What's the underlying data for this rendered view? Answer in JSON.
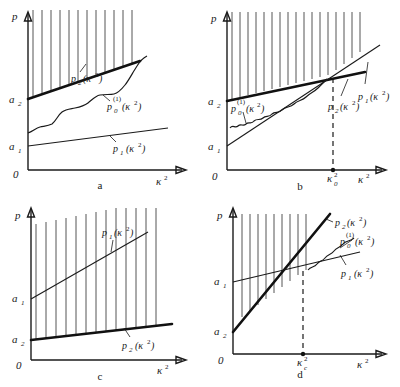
{
  "figure": {
    "title": "",
    "panel_count": 4,
    "axis": {
      "y_label": "p",
      "x_label": "κ²",
      "origin_label": "0"
    }
  },
  "panels": [
    {
      "letter": "a",
      "y_ticks": [
        {
          "base": "a",
          "sub": "2",
          "value_note": "upper intercept of p2"
        },
        {
          "base": "a",
          "sub": "1",
          "value_note": "lower intercept of p1"
        }
      ],
      "x_ticks": [],
      "curves": [
        {
          "name": "p2",
          "label_base": "p",
          "label_sub": "2",
          "label_arg": "(κ²)",
          "label_sup": "",
          "style": "thick-straight",
          "note": "upper bounding line, hatched above"
        },
        {
          "name": "p0_1",
          "label_base": "p",
          "label_sub": "0",
          "label_arg": "(κ²)",
          "label_sup": "(1)",
          "style": "wiggly",
          "note": "staircase-like oscillating curve between p1 and p2"
        },
        {
          "name": "p1",
          "label_base": "p",
          "label_sub": "1",
          "label_arg": "(κ²)",
          "label_sup": "",
          "style": "thin-straight",
          "note": "lowest line, shallow slope"
        }
      ],
      "hatching": {
        "region": "above p2 line",
        "direction": "vertical"
      }
    },
    {
      "letter": "b",
      "y_ticks": [
        {
          "base": "a",
          "sub": "2",
          "value_note": "intercept of p2"
        },
        {
          "base": "a",
          "sub": "1",
          "value_note": "intercept of p1, below a2"
        }
      ],
      "x_ticks": [
        {
          "base": "κ",
          "sub": "0",
          "sup": "2",
          "value_note": "crossing point of p1 and p2"
        }
      ],
      "curves": [
        {
          "name": "p2",
          "label_base": "p",
          "label_sub": "2",
          "label_arg": "(κ²)",
          "label_sup": "",
          "style": "thick-straight",
          "note": "shallow line from a2"
        },
        {
          "name": "p1",
          "label_base": "p",
          "label_sub": "1",
          "label_arg": "(κ²)",
          "label_sup": "",
          "style": "thin-straight",
          "note": "steeper line from a1, crosses p2 at kappa0^2"
        },
        {
          "name": "p0_1",
          "label_base": "p",
          "label_sub": "0",
          "label_arg": "(κ²)",
          "label_sup": "(1)",
          "style": "wiggly",
          "note": "oscillating curve near a2 rising to the crossing"
        }
      ],
      "hatching": {
        "region": "above min(p1,p2) envelope",
        "direction": "vertical"
      },
      "dashed_guide": {
        "from": "crossing point",
        "to": "x-axis at kappa0^2"
      }
    },
    {
      "letter": "c",
      "y_ticks": [
        {
          "base": "a",
          "sub": "1",
          "value_note": "upper intercept of p1"
        },
        {
          "base": "a",
          "sub": "2",
          "value_note": "lower intercept of p2"
        }
      ],
      "x_ticks": [],
      "curves": [
        {
          "name": "p1",
          "label_base": "p",
          "label_sub": "1",
          "label_arg": "(κ²)",
          "label_sup": "",
          "style": "thin-straight",
          "note": "upper line from a1"
        },
        {
          "name": "p2",
          "label_base": "p",
          "label_sub": "2",
          "label_arg": "(κ²)",
          "label_sup": "",
          "style": "thick-straight",
          "note": "lower bounding line from a2, hatched above"
        }
      ],
      "hatching": {
        "region": "between p2 and p1",
        "direction": "vertical"
      }
    },
    {
      "letter": "d",
      "y_ticks": [
        {
          "base": "a",
          "sub": "1",
          "value_note": "upper intercept of p1"
        },
        {
          "base": "a",
          "sub": "2",
          "value_note": "lower intercept of p2"
        }
      ],
      "x_ticks": [
        {
          "base": "κ",
          "sub": "c",
          "sup": "2",
          "value_note": "crossing point of p1 and p2"
        }
      ],
      "curves": [
        {
          "name": "p2",
          "label_base": "p",
          "label_sub": "2",
          "label_arg": "(κ²)",
          "label_sup": "",
          "style": "thick-straight",
          "note": "steep line from a2 crossing p1"
        },
        {
          "name": "p0_1",
          "label_base": "p",
          "label_sub": "0",
          "label_arg": "(κ²)",
          "label_sup": "(1)",
          "style": "wiggly",
          "note": "oscillating curve hugging the crossing region"
        },
        {
          "name": "p1",
          "label_base": "p",
          "label_sub": "1",
          "label_arg": "(κ²)",
          "label_sup": "",
          "style": "thin-straight",
          "note": "shallow line from a1"
        }
      ],
      "hatching": {
        "region": "left of / above crossing, bounded by p2",
        "direction": "vertical"
      },
      "dashed_guide": {
        "from": "crossing point",
        "to": "x-axis at kappa_c^2"
      }
    }
  ],
  "colors": {
    "ink": "#1a1a1a",
    "hatch": "#2a2a2a",
    "background": "#ffffff"
  }
}
